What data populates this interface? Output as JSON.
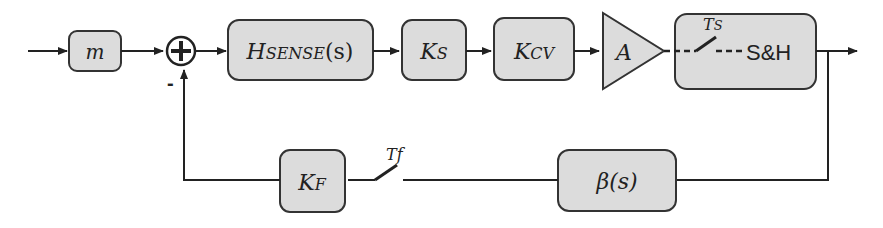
{
  "diagram": {
    "type": "feedback control block diagram",
    "forward_path": {
      "blocks": [
        {
          "id": "m",
          "main": "m",
          "sub": ""
        },
        {
          "id": "hsense",
          "main": "H",
          "sub": "SENSE",
          "suffix": "(s)"
        },
        {
          "id": "ks",
          "main": "K",
          "sub": "S"
        },
        {
          "id": "kcv",
          "main": "K",
          "sub": "CV"
        },
        {
          "id": "amp",
          "main": "A",
          "shape": "triangle"
        },
        {
          "id": "sh",
          "label": "S&H",
          "switch_label_main": "T",
          "switch_label_sub": "S"
        }
      ]
    },
    "summing_junction": {
      "symbol": "+",
      "minus_sign": "-"
    },
    "feedback_path": {
      "blocks": [
        {
          "id": "beta",
          "label": "β(s)"
        },
        {
          "id": "kf",
          "main": "K",
          "sub": "F"
        }
      ],
      "switch_label_main": "T",
      "switch_label_sub": "f"
    }
  }
}
